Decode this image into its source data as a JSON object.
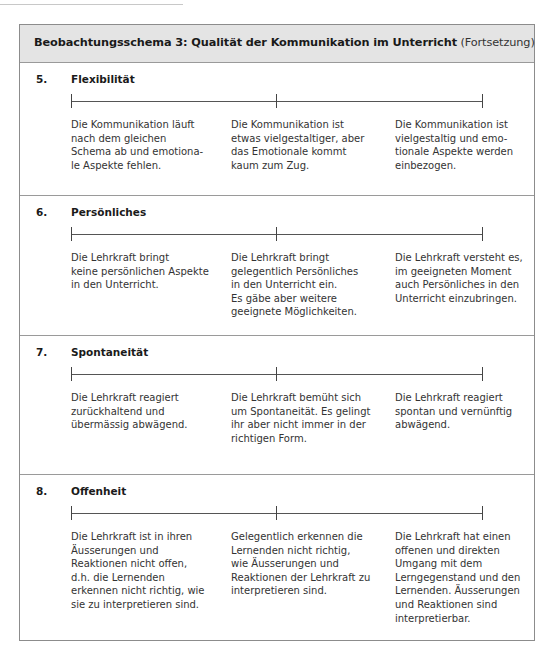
{
  "header": {
    "title_bold": "Beobachtungsschema 3: Qualität der Kommunikation im Unterricht",
    "title_suffix": " (Fortsetzung)"
  },
  "sections": [
    {
      "number": "5.",
      "title": "Flexibilität",
      "scale_ticks": 3,
      "descriptions": [
        "Die Kommunikation läuft\nnach dem gleichen\nSchema ab und emotiona-\nle Aspekte fehlen.",
        "Die Kommunikation ist\netwas vielgestaltiger, aber\ndas Emotionale kommt\nkaum zum Zug.",
        "Die Kommunikation ist\nvielgestaltig und emo-\ntionale Aspekte werden\neinbezogen."
      ]
    },
    {
      "number": "6.",
      "title": "Persönliches",
      "scale_ticks": 3,
      "descriptions": [
        "Die Lehrkraft bringt\nkeine persönlichen Aspekte\nin den Unterricht.",
        "Die Lehrkraft bringt\ngelegentlich Persönliches\nin den Unterricht ein.\nEs gäbe aber weitere\ngeeignete Möglichkeiten.",
        "Die Lehrkraft versteht es,\nim geeigneten Moment\nauch Persönliches in den\nUnterricht einzubringen."
      ]
    },
    {
      "number": "7.",
      "title": "Spontaneität",
      "scale_ticks": 3,
      "descriptions": [
        "Die Lehrkraft reagiert\nzurückhaltend und\nübermässig abwägend.",
        "Die Lehrkraft bemüht sich\num Spontaneität. Es gelingt\nihr aber nicht immer in der\nrichtigen Form.",
        "Die Lehrkraft reagiert\nspontan und vernünftig\nabwägend."
      ]
    },
    {
      "number": "8.",
      "title": "Offenheit",
      "scale_ticks": 3,
      "descriptions": [
        "Die Lehrkraft ist in ihren\nÄusserungen und\nReaktionen nicht offen,\nd.h. die Lernenden\nerkennen nicht richtig, wie\nsie zu interpretieren sind.",
        "Gelegentlich erkennen die\nLernenden nicht richtig,\nwie Äusserungen und\nReaktionen der Lehrkraft zu\ninterpretieren sind.",
        "Die Lehrkraft hat einen\noffenen und direkten\nUmgang mit dem\nLerngegenstand und den\nLernenden. Äusserungen\nund Reaktionen sind\ninterpretierbar."
      ]
    }
  ]
}
